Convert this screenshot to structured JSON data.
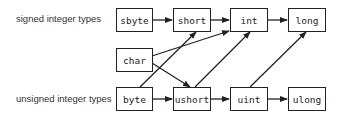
{
  "labels": {
    "signed": "signed integer types",
    "unsigned": "unsigned integer types"
  },
  "nodes": {
    "sbyte": "sbyte",
    "short": "short",
    "int": "int",
    "long": "long",
    "char": "char",
    "byte": "byte",
    "ushort": "ushort",
    "uint": "uint",
    "ulong": "ulong"
  },
  "edges": [
    [
      "sbyte",
      "short"
    ],
    [
      "short",
      "int"
    ],
    [
      "int",
      "long"
    ],
    [
      "byte",
      "ushort"
    ],
    [
      "ushort",
      "uint"
    ],
    [
      "uint",
      "ulong"
    ],
    [
      "char",
      "int"
    ],
    [
      "char",
      "ushort"
    ],
    [
      "byte",
      "short"
    ],
    [
      "ushort",
      "int"
    ],
    [
      "uint",
      "long"
    ]
  ]
}
